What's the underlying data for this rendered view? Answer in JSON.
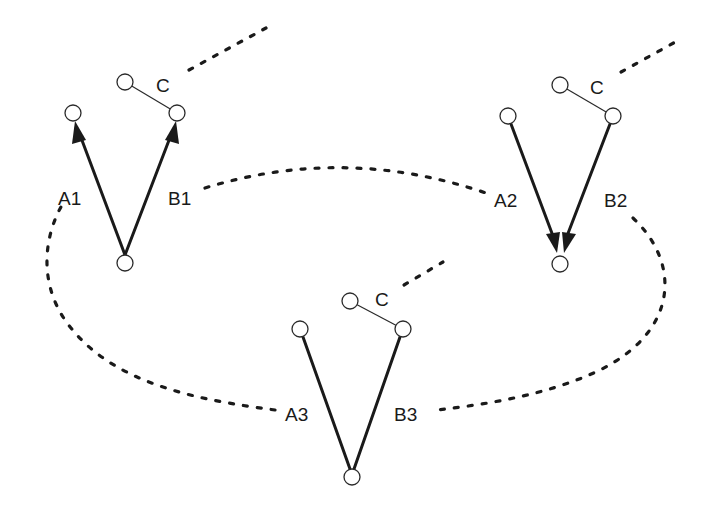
{
  "diagram": {
    "colors": {
      "stroke": "#1a1a1a",
      "node_fill": "#ffffff",
      "background": "#ffffff"
    },
    "groups": [
      {
        "id": "group-1",
        "labels": {
          "a": "A1",
          "b": "B1",
          "c": "C"
        },
        "edge_style": "arrows-up"
      },
      {
        "id": "group-2",
        "labels": {
          "a": "A2",
          "b": "B2",
          "c": "C"
        },
        "edge_style": "arrows-down"
      },
      {
        "id": "group-3",
        "labels": {
          "a": "A3",
          "b": "B3",
          "c": "C"
        },
        "edge_style": "plain"
      }
    ],
    "connections": [
      {
        "from": "B1",
        "to": "A2",
        "style": "dotted"
      },
      {
        "from": "B2",
        "to": "B3",
        "style": "dotted"
      },
      {
        "from": "A3",
        "to": "A1",
        "style": "dotted"
      }
    ]
  }
}
